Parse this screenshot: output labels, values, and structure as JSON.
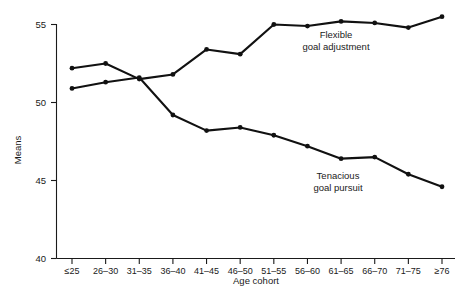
{
  "chart_data": {
    "type": "line",
    "title": "",
    "xlabel": "Age cohort",
    "ylabel": "Means",
    "ylim": [
      40,
      55
    ],
    "yticks": [
      40,
      45,
      50,
      55
    ],
    "ytick_labels": [
      "40",
      "45",
      "50",
      "55"
    ],
    "grid": false,
    "legend_position": "inline-annotation",
    "categories": [
      "≤25",
      "26–30",
      "31–35",
      "36–40",
      "41–45",
      "46–50",
      "51–55",
      "56–60",
      "61–65",
      "66–70",
      "71–75",
      "≥76"
    ],
    "series": [
      {
        "name": "Flexible goal adjustment",
        "values": [
          52.2,
          52.5,
          51.5,
          51.8,
          53.4,
          53.1,
          55.0,
          54.9,
          55.2,
          55.1,
          54.8,
          55.5
        ]
      },
      {
        "name": "Tenacious goal pursuit",
        "values": [
          50.9,
          51.3,
          51.6,
          49.2,
          48.2,
          48.4,
          47.9,
          47.2,
          46.4,
          46.5,
          45.4,
          44.6
        ]
      }
    ],
    "annotations": [
      {
        "name": "flexible-goal-adjustment-label",
        "lines": [
          "Flexible",
          "goal adjustment"
        ],
        "x_px": 336,
        "y_px": 38
      },
      {
        "name": "tenacious-goal-pursuit-label",
        "lines": [
          "Tenacious",
          "goal pursuit"
        ],
        "x_px": 338,
        "y_px": 179
      }
    ],
    "colors": {
      "line": "#111111",
      "axis": "#1a1a1a",
      "background": "#ffffff"
    }
  }
}
